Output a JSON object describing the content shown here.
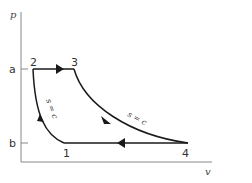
{
  "diagram": {
    "type": "p-v cycle diagram",
    "axes": {
      "y_label": "p",
      "x_label": "v"
    },
    "ticks": {
      "a": "a",
      "b": "b"
    },
    "points": [
      {
        "id": "1",
        "label": "1"
      },
      {
        "id": "2",
        "label": "2"
      },
      {
        "id": "3",
        "label": "3"
      },
      {
        "id": "4",
        "label": "4"
      }
    ],
    "processes": [
      {
        "from": "1",
        "to": "2",
        "label": "s = c"
      },
      {
        "from": "2",
        "to": "3",
        "label": ""
      },
      {
        "from": "3",
        "to": "4",
        "label": "s = c"
      },
      {
        "from": "4",
        "to": "1",
        "label": ""
      }
    ],
    "colors": {
      "axis": "#888888",
      "curve": "#1a1a1a",
      "text": "#333333"
    }
  }
}
